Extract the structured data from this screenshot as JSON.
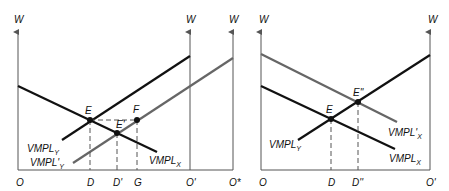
{
  "colors": {
    "dark_curve": "#111111",
    "gray_curve": "#666666",
    "axis": "#555555",
    "background": "#ffffff"
  },
  "left_panel": {
    "axis_labels": {
      "left_w": "W",
      "mid_w": "W",
      "right_w": "W"
    },
    "origin_labels": {
      "o": "O",
      "o_prime": "O'",
      "o_star": "O*"
    },
    "x_labels": {
      "d": "D",
      "d_prime": "D'",
      "g": "G"
    },
    "points": {
      "e": "E",
      "e_prime": "E'",
      "f": "F"
    },
    "curves": {
      "vmpl_x": {
        "base": "VMPL",
        "sub": "X"
      },
      "vmpl_y": {
        "base": "VMPL",
        "sub": "Y"
      },
      "vmpl_y_prime": {
        "base": "VMPL'",
        "sub": "Y"
      }
    }
  },
  "right_panel": {
    "axis_labels": {
      "left_w": "W",
      "right_w": "W"
    },
    "origin_labels": {
      "o": "O",
      "o_prime": "O'"
    },
    "x_labels": {
      "d": "D",
      "d_double_prime": "D''"
    },
    "points": {
      "e": "E",
      "e_double_prime": "E''"
    },
    "curves": {
      "vmpl_x": {
        "base": "VMPL",
        "sub": "X"
      },
      "vmpl_x_prime": {
        "base": "VMPL'",
        "sub": "X"
      },
      "vmpl_y": {
        "base": "VMPL",
        "sub": "Y"
      }
    }
  }
}
